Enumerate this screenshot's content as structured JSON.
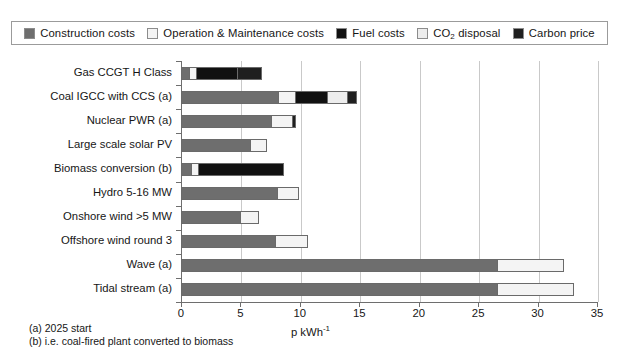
{
  "legend": {
    "items": [
      {
        "label": "Construction costs",
        "key": "construction",
        "color": "#6e6e6e"
      },
      {
        "label": "Operation & Maintenance costs",
        "key": "om",
        "color": "#f4f4f4"
      },
      {
        "label": "Fuel costs",
        "key": "fuel",
        "color": "#111111"
      },
      {
        "label": "CO2 disposal",
        "key": "co2",
        "color": "#ededed"
      },
      {
        "label": "Carbon price",
        "key": "carbon",
        "color": "#1f1f1f"
      }
    ]
  },
  "footnotes": [
    "(a) 2025 start",
    "(b) i.e. coal-fired plant converted to biomass"
  ],
  "chart_data": {
    "type": "bar",
    "orientation": "horizontal",
    "stacked": true,
    "title": "",
    "xlabel": "p kWh-1",
    "ylabel": "",
    "xlim": [
      0,
      35
    ],
    "xticks": [
      0,
      5,
      10,
      15,
      20,
      25,
      30,
      35
    ],
    "grid": "vertical",
    "legend_position": "top",
    "categories": [
      "Gas CCGT H Class",
      "Coal IGCC with CCS (a)",
      "Nuclear PWR (a)",
      "Large scale solar PV",
      "Biomass conversion (b)",
      "Hydro 5-16 MW",
      "Onshore wind >5 MW",
      "Offshore wind round 3",
      "Wave (a)",
      "Tidal stream (a)"
    ],
    "series": [
      {
        "name": "Construction costs",
        "values": [
          0.7,
          8.2,
          7.6,
          5.8,
          0.8,
          8.1,
          5.0,
          7.9,
          26.6,
          26.6
        ]
      },
      {
        "name": "Operation & Maintenance costs",
        "values": [
          0.6,
          1.4,
          1.7,
          1.4,
          0.6,
          1.8,
          1.6,
          2.8,
          5.6,
          6.5
        ]
      },
      {
        "name": "Fuel costs",
        "values": [
          3.4,
          2.7,
          0.0,
          0.0,
          7.3,
          0.0,
          0.0,
          0.0,
          0.0,
          0.0
        ]
      },
      {
        "name": "CO2 disposal",
        "values": [
          0.0,
          1.7,
          0.0,
          0.0,
          0.0,
          0.0,
          0.0,
          0.0,
          0.0,
          0.0
        ]
      },
      {
        "name": "Carbon price",
        "values": [
          2.1,
          0.8,
          0.4,
          0.0,
          0.0,
          0.0,
          0.0,
          0.0,
          0.0,
          0.0
        ]
      }
    ],
    "totals": [
      6.8,
      14.8,
      9.7,
      7.2,
      8.7,
      9.9,
      6.6,
      10.7,
      32.2,
      33.1
    ]
  }
}
